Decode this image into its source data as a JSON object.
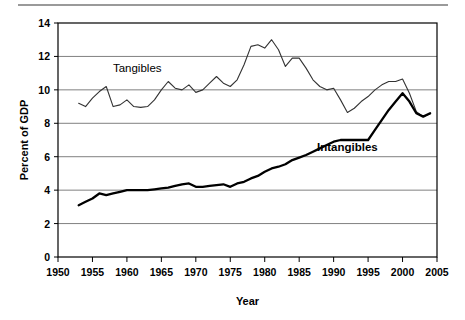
{
  "figure": {
    "background": "#ffffff",
    "top_rule_color": "#9a9a9a",
    "plot_border_color": "#000000",
    "grid_color": "#808080"
  },
  "chart_data": {
    "type": "line",
    "title": "",
    "xlabel": "Year",
    "ylabel": "Percent of GDP",
    "xlim": [
      1950,
      2005
    ],
    "ylim": [
      0,
      14
    ],
    "xticks": [
      1950,
      1955,
      1960,
      1965,
      1970,
      1975,
      1980,
      1985,
      1990,
      1995,
      2000,
      2005
    ],
    "yticks": [
      0,
      2,
      4,
      6,
      8,
      10,
      12,
      14
    ],
    "xtick_labels": [
      "1950",
      "1955",
      "1960",
      "1965",
      "1970",
      "1975",
      "1980",
      "1985",
      "1990",
      "1995",
      "2000",
      "2005"
    ],
    "ytick_labels": [
      "0",
      "2",
      "4",
      "6",
      "8",
      "10",
      "12",
      "14"
    ],
    "grid": "horizontal",
    "legend": "inline-annotations",
    "annotations": [
      {
        "text": "Tangibles",
        "x": 1961.5,
        "y": 11.05,
        "bold": false
      },
      {
        "text": "Intangibles",
        "x": 1992.0,
        "y": 6.35,
        "bold": true
      }
    ],
    "series": [
      {
        "name": "Tangibles",
        "color": "#333333",
        "width": 1.1,
        "x": [
          1953,
          1954,
          1955,
          1956,
          1957,
          1958,
          1959,
          1960,
          1961,
          1962,
          1963,
          1964,
          1965,
          1966,
          1967,
          1968,
          1969,
          1970,
          1971,
          1972,
          1973,
          1974,
          1975,
          1976,
          1977,
          1978,
          1979,
          1980,
          1981,
          1982,
          1983,
          1984,
          1985,
          1986,
          1987,
          1988,
          1989,
          1990,
          1991,
          1992,
          1993,
          1994,
          1995,
          1996,
          1997,
          1998,
          1999,
          2000,
          2001,
          2002,
          2003,
          2004
        ],
        "values": [
          9.2,
          9.0,
          9.5,
          9.9,
          10.2,
          9.0,
          9.1,
          9.4,
          9.0,
          8.95,
          9.0,
          9.4,
          10.0,
          10.5,
          10.1,
          10.0,
          10.3,
          9.85,
          10.0,
          10.4,
          10.8,
          10.4,
          10.2,
          10.6,
          11.5,
          12.6,
          12.7,
          12.5,
          13.0,
          12.4,
          11.4,
          11.9,
          11.9,
          11.3,
          10.6,
          10.2,
          10.0,
          10.1,
          9.4,
          8.65,
          8.9,
          9.3,
          9.6,
          10.0,
          10.3,
          10.5,
          10.5,
          10.65,
          9.8,
          8.7,
          8.4,
          8.55
        ]
      },
      {
        "name": "Intangibles",
        "color": "#000000",
        "width": 2.3,
        "x": [
          1953,
          1954,
          1955,
          1956,
          1957,
          1958,
          1959,
          1960,
          1961,
          1962,
          1963,
          1964,
          1965,
          1966,
          1967,
          1968,
          1969,
          1970,
          1971,
          1972,
          1973,
          1974,
          1975,
          1976,
          1977,
          1978,
          1979,
          1980,
          1981,
          1982,
          1983,
          1984,
          1985,
          1986,
          1987,
          1988,
          1989,
          1990,
          1991,
          1992,
          1993,
          1994,
          1995,
          1996,
          1997,
          1998,
          1999,
          2000,
          2001,
          2002,
          2003,
          2004
        ],
        "values": [
          3.1,
          3.3,
          3.5,
          3.8,
          3.7,
          3.8,
          3.9,
          4.0,
          4.0,
          4.0,
          4.0,
          4.05,
          4.1,
          4.15,
          4.25,
          4.35,
          4.4,
          4.2,
          4.2,
          4.25,
          4.3,
          4.35,
          4.2,
          4.4,
          4.5,
          4.7,
          4.85,
          5.1,
          5.3,
          5.4,
          5.55,
          5.8,
          5.95,
          6.1,
          6.3,
          6.5,
          6.7,
          6.9,
          7.0,
          7.0,
          7.0,
          7.0,
          7.0,
          7.6,
          8.2,
          8.8,
          9.3,
          9.8,
          9.3,
          8.6,
          8.4,
          8.6
        ]
      }
    ]
  }
}
